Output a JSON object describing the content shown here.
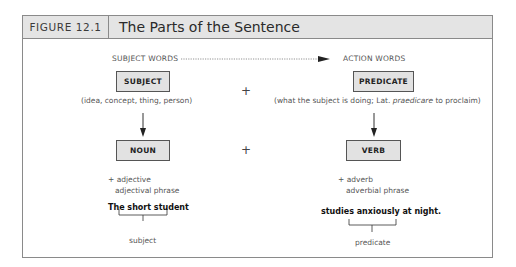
{
  "figure": {
    "label": "FIGURE 12.1",
    "title": "The Parts of the Sentence"
  },
  "columns": {
    "left_heading": "SUBJECT WORDS",
    "right_heading": "ACTION WORDS"
  },
  "row1": {
    "left_box": "SUBJECT",
    "left_note": "(idea, concept, thing, person)",
    "plus": "+",
    "right_box": "PREDICATE",
    "right_note_before": "(what the subject is doing; Lat. ",
    "right_note_italic": "praedicare",
    "right_note_after": " to proclaim)"
  },
  "row2": {
    "left_box": "NOUN",
    "plus": "+",
    "right_box": "VERB"
  },
  "modifiers": {
    "left_line1": "+ adjective",
    "left_line2": "adjectival phrase",
    "right_line1": "+ adverb",
    "right_line2": "adverbial phrase"
  },
  "example": {
    "left_sentence": "The short student",
    "left_label": "subject",
    "right_sentence": "studies anxiously at night.",
    "right_label": "predicate"
  },
  "colors": {
    "box_fill": "#e2e2e2",
    "header_fill": "#e4e4e4",
    "border": "#8a8a8a"
  }
}
